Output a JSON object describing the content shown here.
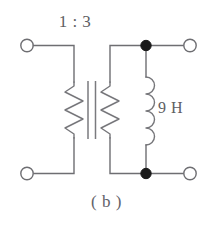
{
  "figure": {
    "caption": "( b )",
    "type": "electrical-schematic",
    "title_visible": false
  },
  "labels": {
    "turns_ratio": "1 : 3",
    "inductance": "9 H"
  },
  "components": [
    {
      "name": "transformer",
      "ratio": "1 : 3",
      "primary_winding": "zigzag",
      "secondary_winding": "zigzag",
      "core": "two-vertical-bars"
    },
    {
      "name": "inductor",
      "value": "9 H",
      "style": "four-arc-coil"
    }
  ],
  "terminals": {
    "left_top": "open-circle",
    "left_bottom": "open-circle",
    "right_top": "open-circle",
    "right_bottom": "open-circle"
  },
  "junctions": {
    "top_right": "filled-dot",
    "bottom_right": "filled-dot"
  },
  "colors": {
    "wire": "#6e6e72",
    "coil": "#76767a",
    "junction": "#1b1b1b",
    "text": "#5e5e63",
    "background": "#ffffff"
  }
}
